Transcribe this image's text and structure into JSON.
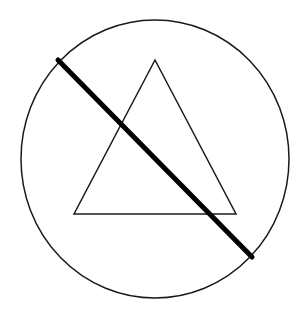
{
  "figure": {
    "width": 304,
    "height": 318,
    "background": "#ffffff",
    "colors": {
      "stroke": "#1a1a1a",
      "thick_line": "#000000"
    },
    "shapes": {
      "circle": {
        "cx": 155,
        "cy": 159,
        "rx": 134,
        "ry": 139,
        "stroke_width": 1.5
      },
      "triangle": {
        "points": "155,60 74,214 236,214",
        "stroke_width": 1.5
      },
      "diagonal": {
        "x1": 58,
        "y1": 60,
        "x2": 252,
        "y2": 257,
        "stroke_width": 5
      }
    }
  }
}
